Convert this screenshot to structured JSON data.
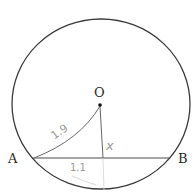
{
  "diagram": {
    "type": "circle-chord-geometry",
    "colors": {
      "line": "#3a3a3a",
      "handwriting": "#9a9a9a",
      "faint": "#c8c8c8",
      "background": "#ffffff"
    },
    "points": {
      "center": {
        "label": "O"
      },
      "chord_start": {
        "label": "A"
      },
      "chord_end": {
        "label": "B"
      }
    },
    "annotations": {
      "radius_length": "1.9",
      "perpendicular_distance": "x",
      "half_chord_length": "1.1"
    }
  }
}
